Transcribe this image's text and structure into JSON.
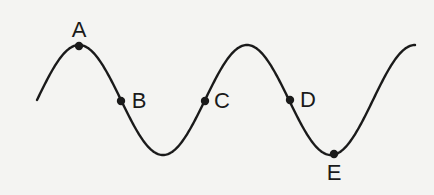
{
  "diagram": {
    "type": "transverse-wave",
    "colors": {
      "background": "#f4f4f2",
      "stroke": "#1a1a1a"
    },
    "wave": {
      "center_y": 100,
      "amplitude": 55,
      "wavelength": 168,
      "x_start": 37,
      "x_end": 415
    },
    "points": [
      {
        "id": "A",
        "label": "A",
        "x": 79,
        "y": 46,
        "label_x": 79,
        "label_y": 30
      },
      {
        "id": "B",
        "label": "B",
        "x": 121,
        "y": 101,
        "label_x": 139,
        "label_y": 101
      },
      {
        "id": "C",
        "label": "C",
        "x": 205,
        "y": 101,
        "label_x": 222,
        "label_y": 101
      },
      {
        "id": "D",
        "label": "D",
        "x": 290,
        "y": 100,
        "label_x": 308,
        "label_y": 100
      },
      {
        "id": "E",
        "label": "E",
        "x": 334,
        "y": 154,
        "label_x": 334,
        "label_y": 173
      }
    ]
  }
}
